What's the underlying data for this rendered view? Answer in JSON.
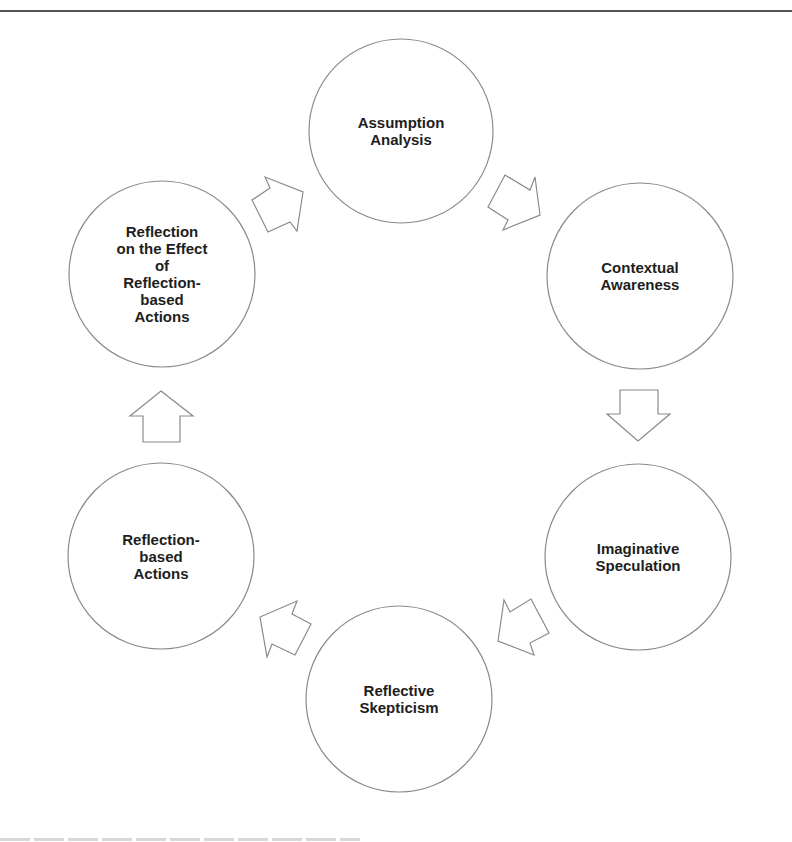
{
  "diagram": {
    "type": "cycle",
    "colors": {
      "circle_stroke": "#8a8a8a",
      "arrow_stroke": "#8a8a8a",
      "text": "#1e1e1e",
      "rule": "#555555"
    },
    "nodes": [
      {
        "id": "assumption-analysis",
        "label": "Assumption\nAnalysis",
        "cx": 401,
        "cy": 131,
        "r": 92
      },
      {
        "id": "contextual-awareness",
        "label": "Contextual\nAwareness",
        "cx": 640,
        "cy": 276,
        "r": 93
      },
      {
        "id": "imaginative-speculation",
        "label": "Imaginative\nSpeculation",
        "cx": 638,
        "cy": 557,
        "r": 93
      },
      {
        "id": "reflective-skepticism",
        "label": "Reflective\nSkepticism",
        "cx": 399,
        "cy": 699,
        "r": 93
      },
      {
        "id": "reflection-based-actions",
        "label": "Reflection-\nbased\nActions",
        "cx": 161,
        "cy": 556,
        "r": 93
      },
      {
        "id": "reflection-on-effect",
        "label": "Reflection\non the Effect\nof\nReflection-\nbased\nActions",
        "cx": 162,
        "cy": 274,
        "r": 93
      }
    ],
    "edges": [
      {
        "from": "reflection-on-effect",
        "to": "assumption-analysis",
        "direction": "up-right"
      },
      {
        "from": "assumption-analysis",
        "to": "contextual-awareness",
        "direction": "down-right"
      },
      {
        "from": "contextual-awareness",
        "to": "imaginative-speculation",
        "direction": "down"
      },
      {
        "from": "imaginative-speculation",
        "to": "reflective-skepticism",
        "direction": "down-left"
      },
      {
        "from": "reflective-skepticism",
        "to": "reflection-based-actions",
        "direction": "up-left"
      },
      {
        "from": "reflection-based-actions",
        "to": "reflection-on-effect",
        "direction": "up"
      }
    ]
  }
}
